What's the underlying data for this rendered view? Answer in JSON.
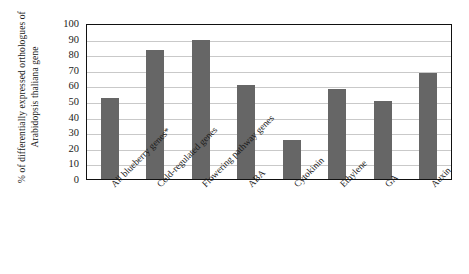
{
  "chart_data": {
    "type": "bar",
    "title": "",
    "xlabel": "",
    "ylabel": "% of differentially expressed orthologues of Arabidopsis thaliana gene",
    "ylim": [
      0,
      100
    ],
    "ytick_step": 10,
    "yticks": [
      "0",
      "10",
      "20",
      "30",
      "40",
      "50",
      "60",
      "70",
      "80",
      "90",
      "100"
    ],
    "grid": true,
    "legend": "none",
    "bar_color": "#666666",
    "axis_color": "#111111",
    "gridline_color": "#c9c9c9",
    "categories": [
      "All blueberry genes*",
      "Cold-regulated genes",
      "Flowering pathway genes",
      "ABA",
      "Cytokinin",
      "Ethylene",
      "GA",
      "Auxin"
    ],
    "values": [
      52,
      83,
      89,
      60,
      25,
      58,
      50,
      68
    ]
  }
}
